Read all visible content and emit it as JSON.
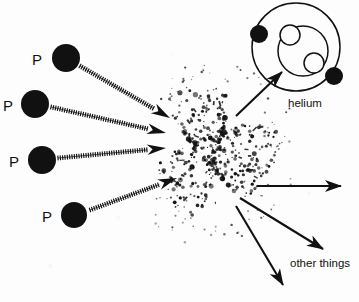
{
  "diagram": {
    "background_color": "#fdfdfd",
    "ink_color": "#111111",
    "width": 359,
    "height": 302
  },
  "reactants": {
    "label_text": "P",
    "count": 4,
    "particles": [
      {
        "name": "proton-1",
        "label": "P",
        "cx": 66,
        "cy": 58,
        "r": 14,
        "label_x": 32,
        "label_y": 52
      },
      {
        "name": "proton-2",
        "label": "P",
        "cx": 35,
        "cy": 104,
        "r": 14,
        "label_x": 3,
        "label_y": 98
      },
      {
        "name": "proton-3",
        "label": "P",
        "cx": 42,
        "cy": 160,
        "r": 14,
        "label_x": 9,
        "label_y": 154
      },
      {
        "name": "proton-4",
        "label": "P",
        "cx": 74,
        "cy": 215,
        "r": 13,
        "label_x": 42,
        "label_y": 209
      }
    ]
  },
  "reaction_zone": {
    "name": "particle-burst",
    "cx": 212,
    "cy": 150,
    "rx": 62,
    "ry": 70,
    "dot_count": 430
  },
  "incoming_arrows": [
    {
      "name": "incoming-arrow-1",
      "x1": 80,
      "y1": 66,
      "x2": 170,
      "y2": 118,
      "style": "dashed-hatched"
    },
    {
      "name": "incoming-arrow-2",
      "x1": 51,
      "y1": 107,
      "x2": 166,
      "y2": 133,
      "style": "dashed-hatched"
    },
    {
      "name": "incoming-arrow-3",
      "x1": 58,
      "y1": 158,
      "x2": 166,
      "y2": 148,
      "style": "dashed-hatched"
    },
    {
      "name": "incoming-arrow-4",
      "x1": 90,
      "y1": 210,
      "x2": 177,
      "y2": 178,
      "style": "dashed-hatched"
    }
  ],
  "outgoing_arrows": [
    {
      "name": "arrow-to-helium",
      "x1": 236,
      "y1": 116,
      "x2": 282,
      "y2": 72,
      "style": "solid"
    },
    {
      "name": "arrow-right-straight",
      "x1": 257,
      "y1": 186,
      "x2": 341,
      "y2": 186,
      "style": "solid"
    },
    {
      "name": "arrow-other-things",
      "x1": 240,
      "y1": 198,
      "x2": 323,
      "y2": 249,
      "style": "solid"
    },
    {
      "name": "arrow-down-left",
      "x1": 236,
      "y1": 206,
      "x2": 283,
      "y2": 285,
      "style": "solid"
    }
  ],
  "products": {
    "helium": {
      "name": "helium-atom",
      "label": "helium",
      "label_x": 288,
      "label_y": 98,
      "outer_shell": {
        "cx": 296,
        "cy": 47,
        "r": 44
      },
      "inner_shell": {
        "cx": 303,
        "cy": 51,
        "r": 25
      },
      "electrons": [
        {
          "name": "electron-1",
          "cx": 259,
          "cy": 34,
          "r": 9
        },
        {
          "name": "electron-2",
          "cx": 334,
          "cy": 76,
          "r": 9
        }
      ],
      "nucleons": [
        {
          "name": "nucleon-1",
          "cx": 290,
          "cy": 35,
          "r": 10
        },
        {
          "name": "nucleon-2",
          "cx": 314,
          "cy": 63,
          "r": 10
        }
      ]
    },
    "other_things": {
      "name": "other-things-product",
      "label": "other things",
      "label_x": 290,
      "label_y": 258
    }
  }
}
